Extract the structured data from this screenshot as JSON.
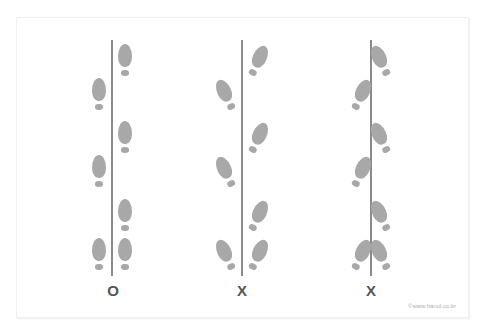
{
  "figure": {
    "colors": {
      "footprint": "#a8a8a8",
      "line": "#8a8a8a",
      "label": "#555555",
      "credit": "#b0b0b0"
    },
    "columns": [
      {
        "id": "straight",
        "verdict": "O",
        "toe_orientation": "straight",
        "line_x": 112
      },
      {
        "id": "out-toed",
        "verdict": "X",
        "toe_orientation": "outward",
        "line_x": 242
      },
      {
        "id": "in-toed",
        "verdict": "X",
        "toe_orientation": "inward",
        "line_x": 371
      }
    ],
    "footprints": [
      {
        "side": "right",
        "y": 44
      },
      {
        "side": "left",
        "y": 78
      },
      {
        "side": "right",
        "y": 121
      },
      {
        "side": "left",
        "y": 155
      },
      {
        "side": "right",
        "y": 199
      },
      {
        "side": "left",
        "y": 238
      },
      {
        "side": "right",
        "y": 238
      }
    ],
    "credit": "©www.hanol.co.kr"
  }
}
